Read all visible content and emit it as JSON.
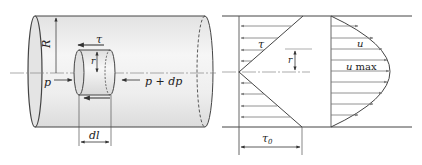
{
  "figure": {
    "left_panel": {
      "title": "Pipe with fluid element (force balance)",
      "labels": {
        "radius": "R",
        "inner_radius": "r",
        "shear_stress": "τ",
        "pressure_in": "p",
        "pressure_out": "p + dp",
        "element_length": "dl"
      }
    },
    "middle_panel": {
      "title": "Shear stress distribution",
      "labels": {
        "shear_stress": "τ",
        "radius": "r",
        "wall_shear_stress": "τ",
        "wall_shear_subscript": "0"
      }
    },
    "right_panel": {
      "title": "Velocity distribution",
      "labels": {
        "velocity": "u",
        "max_velocity_symbol": "u",
        "max_velocity_subscript": "max"
      }
    },
    "colors": {
      "line": "#444444",
      "pipe_fill": "#ececec",
      "pipe_fill_light": "#f7f7f7",
      "arrow": "#777777",
      "centerline": "#888888"
    }
  }
}
